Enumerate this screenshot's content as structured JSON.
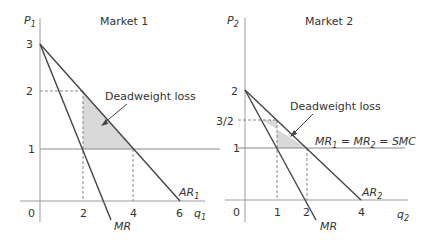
{
  "markets": [
    {
      "title": "Market 1",
      "y_axis_label": "P",
      "y_axis_sub": "1",
      "x_axis_label": "q",
      "x_axis_sub": "1",
      "origin": "0",
      "y_ticks": [
        "3",
        "2",
        "1"
      ],
      "x_ticks": [
        "2",
        "4",
        "6"
      ],
      "ar_label": "AR",
      "ar_sub": "1",
      "mr_label": "MR",
      "annotation": "Deadweight loss"
    },
    {
      "title": "Market 2",
      "y_axis_label": "P",
      "y_axis_sub": "2",
      "x_axis_label": "q",
      "x_axis_sub": "2",
      "origin": "0",
      "y_ticks": [
        "2",
        "3/2",
        "1"
      ],
      "x_ticks": [
        "1",
        "2",
        "4"
      ],
      "ar_label": "AR",
      "ar_sub": "2",
      "mr_label": "MR",
      "annotation": "Deadweight loss",
      "smc_label_parts": [
        "MR",
        "1",
        " = MR",
        "2",
        " = SMC"
      ]
    }
  ],
  "colors": {
    "line": "#444444",
    "shade": "#d9d9d9",
    "axis": "#9a9a9a"
  }
}
